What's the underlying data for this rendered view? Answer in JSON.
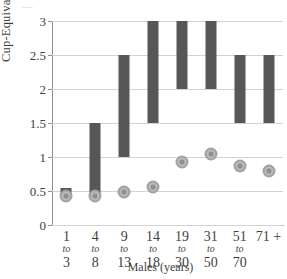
{
  "chart_data": {
    "type": "bar",
    "title": "",
    "xlabel": "Males (years)",
    "ylabel": "Cup-Equivalents",
    "ylim": [
      0,
      3
    ],
    "yticks": [
      "0",
      "0.5",
      "1",
      "1.5",
      "2",
      "2.5",
      "3"
    ],
    "ytick_values": [
      0,
      0.5,
      1,
      1.5,
      2,
      2.5,
      3
    ],
    "grid": true,
    "legend": "none",
    "categories": [
      "1 to 3",
      "4 to 8",
      "9 to 13",
      "14 to 18",
      "19 to 30",
      "31 to 50",
      "51 to 70",
      "71 +"
    ],
    "category_parts": [
      {
        "start": "1",
        "to": "to",
        "end": "3"
      },
      {
        "start": "4",
        "to": "to",
        "end": "8"
      },
      {
        "start": "9",
        "to": "to",
        "end": "13"
      },
      {
        "start": "14",
        "to": "to",
        "end": "18"
      },
      {
        "start": "19",
        "to": "to",
        "end": "30"
      },
      {
        "start": "31",
        "to": "to",
        "end": "50"
      },
      {
        "start": "51",
        "to": "to",
        "end": "70"
      },
      {
        "start": "71 +",
        "to": "",
        "end": ""
      }
    ],
    "series": [
      {
        "name": "Recommended range",
        "type": "range-bar",
        "color": "#575757",
        "low": [
          0.4,
          0.4,
          1.0,
          1.5,
          2.0,
          2.0,
          1.5,
          1.5
        ],
        "high": [
          0.55,
          1.5,
          2.5,
          3.0,
          3.0,
          3.0,
          2.5,
          2.5
        ]
      },
      {
        "name": "Average intake",
        "type": "marker",
        "color": "#b9b9b9",
        "values": [
          0.42,
          0.42,
          0.48,
          0.56,
          0.93,
          1.05,
          0.87,
          0.8
        ]
      }
    ]
  }
}
